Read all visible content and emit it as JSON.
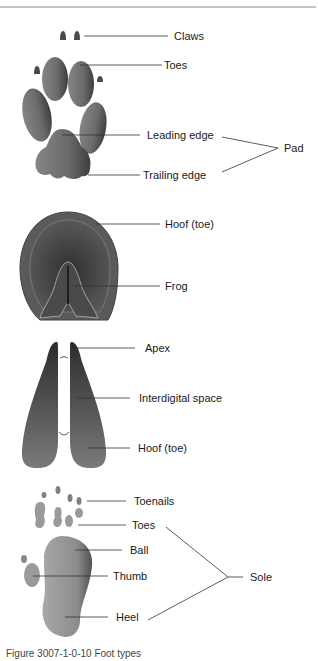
{
  "diagram": {
    "title": "Foot types",
    "panels": [
      {
        "id": "paw",
        "labels": {
          "claws": "Claws",
          "toes": "Toes",
          "leading_edge": "Leading edge",
          "trailing_edge": "Trailing edge",
          "pad": "Pad"
        }
      },
      {
        "id": "hoof",
        "labels": {
          "hoof_toe": "Hoof (toe)",
          "frog": "Frog"
        }
      },
      {
        "id": "cloven-hoof",
        "labels": {
          "apex": "Apex",
          "interdigital_space": "Interdigital space",
          "hoof_toe": "Hoof (toe)"
        }
      },
      {
        "id": "plantigrade-foot",
        "labels": {
          "toenails": "Toenails",
          "toes": "Toes",
          "ball": "Ball",
          "thumb": "Thumb",
          "heel": "Heel",
          "sole": "Sole"
        }
      }
    ],
    "caption": "Figure 3007-1-0-10  Foot types"
  },
  "colors": {
    "shape_dark": "#3a3a3a",
    "shape_mid": "#6e6e6e",
    "shape_light": "#9a9a9a",
    "leader_line": "#333333",
    "rule": "#8a8a8a"
  }
}
